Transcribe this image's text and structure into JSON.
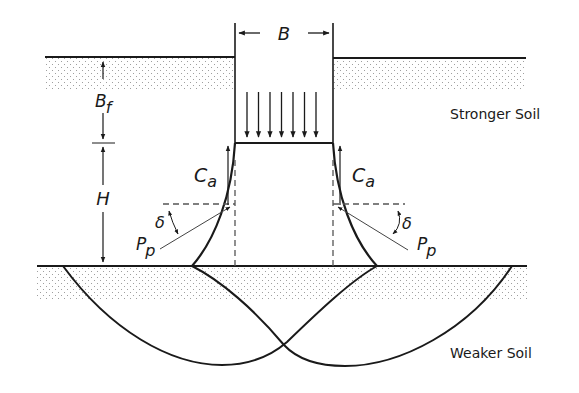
{
  "figure": {
    "colors": {
      "line": "#1a1a1a",
      "dashed": "#555555",
      "stipple": "#9a9a9a",
      "background": "#ffffff"
    }
  },
  "labels": {
    "footing_width": "B",
    "depth_below_footing": "B",
    "depth_below_footing_sub": "f",
    "layer_thickness": "H",
    "adhesion_left": "C",
    "adhesion_left_sub": "a",
    "adhesion_right": "C",
    "adhesion_right_sub": "a",
    "passive_left": "P",
    "passive_left_sub": "p",
    "passive_right": "P",
    "passive_right_sub": "p",
    "angle_left": "δ",
    "angle_right": "δ",
    "upper_layer": "Stronger Soil",
    "lower_layer": "Weaker Soil"
  },
  "load_arrows": {
    "count": 7
  }
}
